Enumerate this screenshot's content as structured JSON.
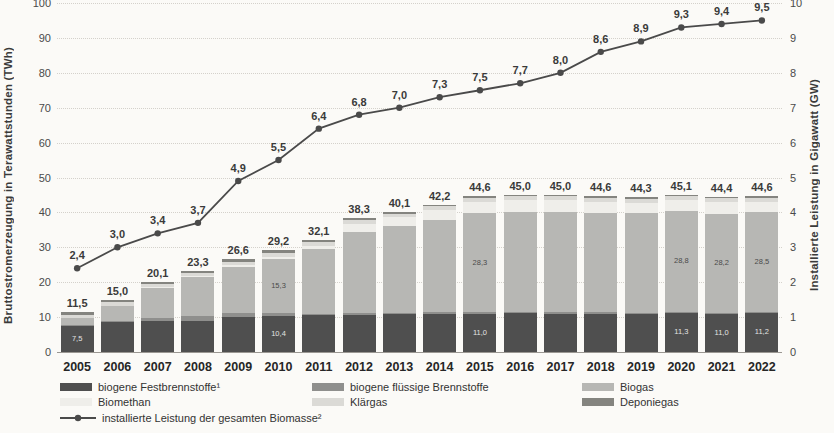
{
  "chart_data": {
    "type": "bar",
    "subtype": "stacked-bars-with-line-overlay",
    "ylabel_left": "Bruttostromerzeugung in Terawattstunden (TWh)",
    "ylabel_right": "Installierte Leistung in Gigawatt (GW)",
    "ylim_left": [
      0,
      100
    ],
    "ylim_right": [
      0,
      10
    ],
    "yticks_left": [
      0,
      10,
      20,
      30,
      40,
      50,
      60,
      70,
      80,
      90,
      100
    ],
    "yticks_right": [
      0,
      1,
      2,
      3,
      4,
      5,
      6,
      7,
      8,
      9,
      10
    ],
    "grid": "horizontal-dotted",
    "legend_position": "bottom",
    "categories": [
      "2005",
      "2006",
      "2007",
      "2008",
      "2009",
      "2010",
      "2011",
      "2012",
      "2013",
      "2014",
      "2015",
      "2016",
      "2017",
      "2018",
      "2019",
      "2020",
      "2021",
      "2022"
    ],
    "series": [
      {
        "name": "biogene Festbrennstoffe¹",
        "color": "#4f4f4f",
        "values": [
          7.5,
          8.5,
          8.8,
          9.0,
          10.0,
          10.4,
          10.5,
          10.7,
          10.8,
          11.0,
          11.0,
          11.1,
          11.0,
          11.0,
          11.0,
          11.3,
          11.0,
          11.2
        ]
      },
      {
        "name": "biogene flüssige Brennstoffe",
        "color": "#8f8f8d",
        "values": [
          0.2,
          0.4,
          1.0,
          1.2,
          1.1,
          0.9,
          0.5,
          0.4,
          0.4,
          0.4,
          0.4,
          0.4,
          0.4,
          0.4,
          0.3,
          0.3,
          0.3,
          0.3
        ]
      },
      {
        "name": "Biogas",
        "color": "#b7b7b4",
        "values": [
          2.0,
          4.4,
          8.6,
          11.2,
          13.3,
          15.3,
          18.5,
          23.2,
          24.8,
          26.4,
          28.3,
          28.7,
          28.8,
          28.5,
          28.4,
          28.8,
          28.2,
          28.5
        ]
      },
      {
        "name": "Biomethan",
        "color": "#efeeea",
        "values": [
          0.0,
          0.0,
          0.1,
          0.3,
          0.5,
          0.7,
          1.0,
          2.5,
          2.6,
          2.9,
          3.4,
          3.3,
          3.3,
          3.2,
          3.1,
          3.2,
          3.4,
          3.1
        ]
      },
      {
        "name": "Klärgas",
        "color": "#dbdad6",
        "values": [
          0.9,
          0.9,
          0.9,
          0.9,
          1.0,
          1.1,
          1.0,
          1.0,
          1.0,
          1.0,
          1.1,
          1.1,
          1.1,
          1.1,
          1.1,
          1.1,
          1.1,
          1.1
        ]
      },
      {
        "name": "Deponiegas",
        "color": "#84847f",
        "values": [
          0.9,
          0.8,
          0.7,
          0.7,
          0.7,
          0.8,
          0.6,
          0.5,
          0.5,
          0.5,
          0.4,
          0.4,
          0.4,
          0.4,
          0.4,
          0.4,
          0.4,
          0.4
        ]
      }
    ],
    "bar_totals": [
      11.5,
      15.0,
      20.1,
      23.3,
      26.6,
      29.2,
      32.1,
      38.3,
      40.1,
      42.2,
      44.6,
      45.0,
      45.0,
      44.6,
      44.3,
      45.1,
      44.4,
      44.6
    ],
    "line_series": {
      "name": "installierte Leistung der gesamten Biomasse²",
      "axis": "right",
      "color": "#4a4a4a",
      "values": [
        2.4,
        3.0,
        3.4,
        3.7,
        4.9,
        5.5,
        6.4,
        6.8,
        7.0,
        7.3,
        7.5,
        7.7,
        8.0,
        8.6,
        8.9,
        9.3,
        9.4,
        9.5
      ]
    },
    "inside_labels": {
      "festbrennstoffe_years": [
        "2005",
        "2010",
        "2015",
        "2020",
        "2021",
        "2022"
      ],
      "biogas_years": [
        "2010",
        "2015",
        "2020",
        "2021",
        "2022"
      ]
    }
  },
  "legend": {
    "items": [
      {
        "label": "biogene Festbrennstoffe¹",
        "color": "#4f4f4f",
        "row": 0,
        "col": 0,
        "type": "swatch"
      },
      {
        "label": "biogene flüssige Brennstoffe",
        "color": "#8f8f8d",
        "row": 0,
        "col": 1,
        "type": "swatch"
      },
      {
        "label": "Biogas",
        "color": "#b7b7b4",
        "row": 0,
        "col": 2,
        "type": "swatch"
      },
      {
        "label": "Biomethan",
        "color": "#efeeea",
        "row": 1,
        "col": 0,
        "type": "swatch"
      },
      {
        "label": "Klärgas",
        "color": "#dbdad6",
        "row": 1,
        "col": 1,
        "type": "swatch"
      },
      {
        "label": "Deponiegas",
        "color": "#84847f",
        "row": 1,
        "col": 2,
        "type": "swatch"
      },
      {
        "label": "installierte Leistung der gesamten Biomasse²",
        "color": "#4a4a4a",
        "row": 2,
        "col": 0,
        "type": "line"
      }
    ]
  }
}
